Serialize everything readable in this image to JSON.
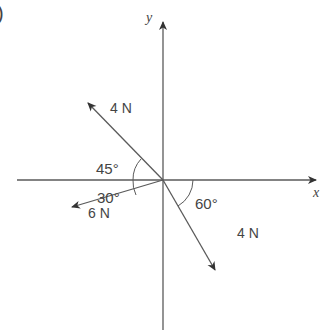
{
  "figure": {
    "part_label": ")",
    "axes": {
      "x_label": "x",
      "y_label": "y"
    },
    "forces": [
      {
        "magnitude": "4 N",
        "direction": "upper-left",
        "angle_label": "45°",
        "angle_from": "negative x-axis"
      },
      {
        "magnitude": "6 N",
        "direction": "lower-left",
        "angle_label": "30°",
        "angle_from": "negative x-axis"
      },
      {
        "magnitude": "4 N",
        "direction": "lower-right",
        "angle_label": "60°",
        "angle_from": "positive x-axis"
      }
    ],
    "colors": {
      "line": "#5a5a5a",
      "text": "#444444",
      "background": "#ffffff"
    }
  }
}
